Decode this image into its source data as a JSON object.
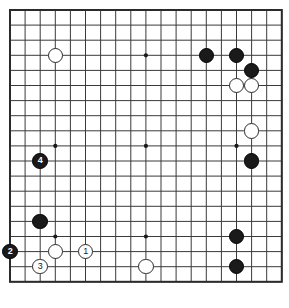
{
  "diagram": {
    "kind": "go-board-diagram",
    "board_size": 19,
    "background_color": "#ffffff",
    "line_color": "#3a3a3a",
    "border_color": "#2b2b2b",
    "black_color": "#1a1a1a",
    "white_color": "#ffffff",
    "grid": {
      "origin_x": 10,
      "origin_y": 10,
      "spacing": 15.1,
      "columns": 19,
      "rows": 19
    },
    "star_points": [
      {
        "col": 3,
        "row": 3
      },
      {
        "col": 9,
        "row": 3
      },
      {
        "col": 15,
        "row": 3
      },
      {
        "col": 3,
        "row": 9
      },
      {
        "col": 9,
        "row": 9
      },
      {
        "col": 15,
        "row": 9
      },
      {
        "col": 3,
        "row": 15
      },
      {
        "col": 9,
        "row": 15
      },
      {
        "col": 15,
        "row": 15
      }
    ],
    "stones": [
      {
        "id": "w-d16",
        "color": "white",
        "col": 3,
        "row": 3,
        "label": ""
      },
      {
        "id": "b-n16",
        "color": "black",
        "col": 13,
        "row": 3,
        "label": ""
      },
      {
        "id": "b-p16",
        "color": "black",
        "col": 15,
        "row": 3,
        "label": ""
      },
      {
        "id": "b-q15",
        "color": "black",
        "col": 16,
        "row": 4,
        "label": ""
      },
      {
        "id": "w-p14",
        "color": "white",
        "col": 15,
        "row": 5,
        "label": ""
      },
      {
        "id": "w-q14",
        "color": "white",
        "col": 16,
        "row": 5,
        "label": ""
      },
      {
        "id": "w-q12",
        "color": "white",
        "col": 16,
        "row": 8,
        "label": ""
      },
      {
        "id": "b-c9",
        "color": "black",
        "col": 2,
        "row": 10,
        "label": "4"
      },
      {
        "id": "b-q10",
        "color": "black",
        "col": 16,
        "row": 10,
        "label": ""
      },
      {
        "id": "b-c5",
        "color": "black",
        "col": 2,
        "row": 14,
        "label": ""
      },
      {
        "id": "b-p4",
        "color": "black",
        "col": 15,
        "row": 15,
        "label": ""
      },
      {
        "id": "b-a3",
        "color": "black",
        "col": 0,
        "row": 16,
        "label": "2"
      },
      {
        "id": "w-d3",
        "color": "white",
        "col": 3,
        "row": 16,
        "label": ""
      },
      {
        "id": "w-f3",
        "color": "white",
        "col": 5,
        "row": 16,
        "label": "1"
      },
      {
        "id": "w-c2",
        "color": "white",
        "col": 2,
        "row": 17,
        "label": "3"
      },
      {
        "id": "w-k2",
        "color": "white",
        "col": 9,
        "row": 17,
        "label": ""
      },
      {
        "id": "b-p2",
        "color": "black",
        "col": 15,
        "row": 17,
        "label": ""
      }
    ],
    "move_numbers": [
      "1",
      "2",
      "3",
      "4"
    ]
  }
}
